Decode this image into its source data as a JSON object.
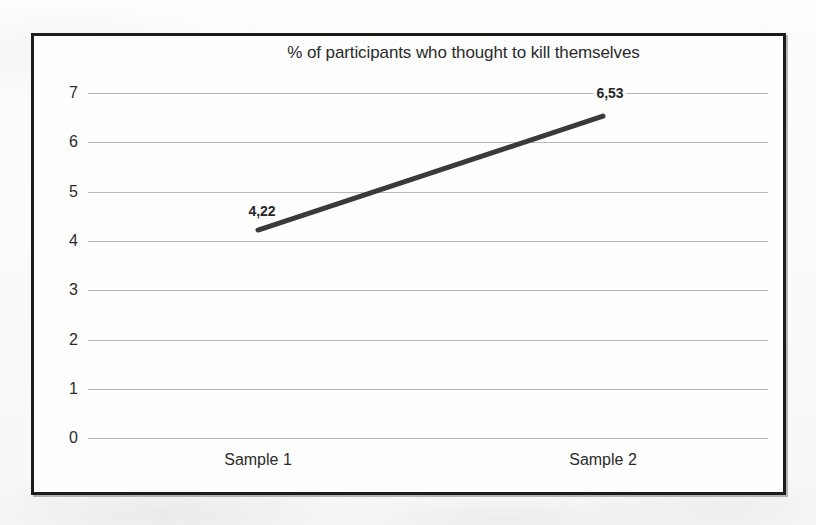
{
  "chart_data": {
    "type": "line",
    "title": "% of participants who thought to kill themselves",
    "xlabel": "",
    "ylabel": "",
    "categories": [
      "Sample 1",
      "Sample 2"
    ],
    "x": [
      "Sample 1",
      "Sample 2"
    ],
    "values": [
      4.22,
      6.53
    ],
    "point_labels": [
      "4,22",
      "6,53"
    ],
    "series": [
      {
        "name": "% of participants who thought to kill themselves",
        "values": [
          4.22,
          6.53
        ],
        "labels": [
          "4,22",
          "6,53"
        ],
        "color": "#3a3a3a",
        "line_width": 5
      }
    ],
    "ylim": [
      0,
      7
    ],
    "yticks": [
      0,
      1,
      2,
      3,
      4,
      5,
      6,
      7
    ],
    "ytick_labels": [
      "0",
      "1",
      "2",
      "3",
      "4",
      "5",
      "6",
      "7"
    ],
    "xtick_labels": [
      "Sample 1",
      "Sample 2"
    ],
    "grid": true,
    "grid_axis": "y",
    "grid_color": "#b9b9b9",
    "legend": false,
    "legend_position": "none",
    "markers": false,
    "decimal_separator": ",",
    "border_color": "#1d1d1d",
    "plot_background": "#fefefe"
  }
}
